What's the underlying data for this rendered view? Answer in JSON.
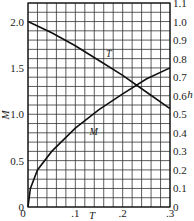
{
  "chart_data": {
    "type": "line",
    "title": "",
    "xlabel": "T",
    "ylabel_left": "M",
    "ylabel_right": "h",
    "xlim": [
      0,
      0.3
    ],
    "ylim_left": [
      0,
      2.0
    ],
    "ylim_right": [
      0,
      1.1
    ],
    "grid": true,
    "x_ticks": [
      "0",
      ".1",
      ".2",
      ".3"
    ],
    "y_left_ticks": [
      "0",
      "0.5",
      "1.0",
      "1.5",
      "2.0"
    ],
    "y_right_ticks": [
      "0",
      "0.1",
      "0.2",
      "0.3",
      "0.4",
      "0.5",
      "0.6",
      "0.7",
      "0.8",
      "0.9",
      "1.0",
      "1.1"
    ],
    "series": [
      {
        "name": "T",
        "axis": "left",
        "x": [
          0,
          0.05,
          0.1,
          0.15,
          0.2,
          0.25,
          0.3
        ],
        "values": [
          2.0,
          1.88,
          1.74,
          1.58,
          1.42,
          1.24,
          1.06
        ]
      },
      {
        "name": "M",
        "axis": "left",
        "x": [
          0,
          0.005,
          0.02,
          0.05,
          0.1,
          0.15,
          0.2,
          0.25,
          0.3
        ],
        "values": [
          0,
          0.2,
          0.4,
          0.6,
          0.85,
          1.05,
          1.22,
          1.38,
          1.5
        ]
      }
    ],
    "annotations": [
      {
        "text": "T",
        "near_series": "T"
      },
      {
        "text": "M",
        "near_series": "M"
      }
    ]
  }
}
